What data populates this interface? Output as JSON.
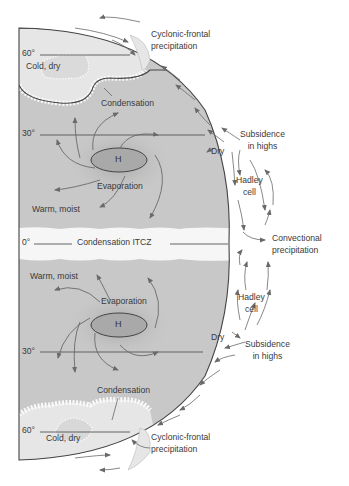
{
  "diagram": {
    "colors": {
      "background": "#ffffff",
      "earth_fill": "#c8c8c8",
      "polar_fill": "#e4e4e4",
      "cloud_band": "#f4f4f4",
      "high_pressure_fill": "#a9a9a9",
      "outline": "#444444",
      "arrow": "#6a6a6a",
      "text": "#3a3a3a"
    },
    "latitudes": {
      "north_60": "60°",
      "north_30": "30°",
      "equator": "0°",
      "south_30": "30°",
      "south_60": "60°"
    },
    "labels": {
      "cyclonic_frontal_north_line1": "Cyclonic-frontal",
      "cyclonic_frontal_north_line2": "precipitation",
      "cold_dry_north": "Cold, dry",
      "condensation_north": "Condensation",
      "high_north": "H",
      "evaporation_north": "Evaporation",
      "warm_moist_north": "Warm, moist",
      "dry_north": "Dry",
      "subsidence_north_line1": "Subsidence",
      "subsidence_north_line2": "in highs",
      "hadley_north_line1": "Hadley",
      "hadley_north_line2": "cell",
      "itcz": "Condensation ITCZ",
      "convectional_line1": "Convectional",
      "convectional_line2": "precipitation",
      "warm_moist_south": "Warm, moist",
      "evaporation_south": "Evaporation",
      "high_south": "H",
      "hadley_south_line1": "Hadley",
      "hadley_south_line2": "cell",
      "dry_south": "Dry",
      "subsidence_south_line1": "Subsidence",
      "subsidence_south_line2": "in highs",
      "condensation_south": "Condensation",
      "cold_dry_south": "Cold, dry",
      "cyclonic_frontal_south_line1": "Cyclonic-frontal",
      "cyclonic_frontal_south_line2": "precipitation"
    }
  }
}
